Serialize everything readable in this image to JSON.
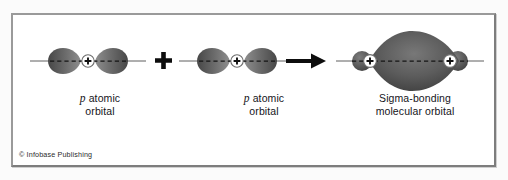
{
  "figure": {
    "kind": "chemistry-orbital-diagram",
    "caption_copyright": "© Infobase Publishing",
    "frame": {
      "border_color": "#8e8e8e",
      "background_color": "#ffffff"
    },
    "palette": {
      "lobe_fill_dark": "#4a4a4a",
      "lobe_fill_mid": "#676767",
      "lobe_fill_light": "#8d8d8d",
      "axis_line": "#4d4d4d",
      "node_dash": "#1d1d1d",
      "nucleus_fill": "#ffffff",
      "nucleus_stroke": "#6d6d6d",
      "operator_color": "#0d0d0d",
      "text_color": "#15151a"
    },
    "labels": [
      {
        "id": "left-orbital-label",
        "line1_italic": "p",
        "line1_rest": " atomic",
        "line2": "orbital"
      },
      {
        "id": "middle-orbital-label",
        "line1_italic": "p",
        "line1_rest": " atomic",
        "line2": "orbital"
      },
      {
        "id": "product-orbital-label",
        "line1_italic": "",
        "line1_rest": "Sigma-bonding",
        "line2": "molecular orbital"
      }
    ],
    "operators": [
      {
        "id": "plus-operator",
        "glyph": "+",
        "meaning": "plus"
      },
      {
        "id": "arrow-operator",
        "glyph": "→",
        "meaning": "yields"
      }
    ],
    "reactants": [
      {
        "id": "p-orbital-1",
        "type": "p atomic orbital",
        "nucleus_sign": "+",
        "lobe_count": 2
      },
      {
        "id": "p-orbital-2",
        "type": "p atomic orbital",
        "nucleus_sign": "+",
        "lobe_count": 2
      }
    ],
    "product": {
      "id": "sigma-molecular-orbital",
      "type": "Sigma-bonding molecular orbital",
      "nucleus_count": 2,
      "nucleus_sign": "+",
      "central_lobe_shape": "lens",
      "outer_lobe_count": 2
    }
  }
}
